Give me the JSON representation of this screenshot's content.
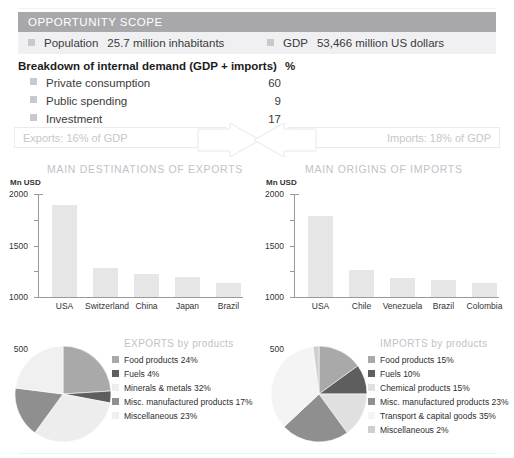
{
  "scope": {
    "header_title": "OPPORTUNITY SCOPE",
    "population_label": "Population",
    "population_value": "25.7 million inhabitants",
    "gdp_label": "GDP",
    "gdp_value": "53,466 million US dollars"
  },
  "breakdown": {
    "title": "Breakdown of internal demand (GDP + imports)",
    "unit": "%",
    "rows": [
      {
        "label": "Private consumption",
        "value": "60"
      },
      {
        "label": "Public spending",
        "value": "9"
      },
      {
        "label": "Investment",
        "value": "17"
      }
    ]
  },
  "flows": {
    "exports_label": "Exports: 16% of GDP",
    "imports_label": "Imports: 18% of GDP"
  },
  "sections": {
    "exports_title": "MAIN DESTINATIONS OF EXPORTS",
    "imports_title": "MAIN ORIGINS OF IMPORTS"
  },
  "colors": {
    "header_bar": "#a8a8ac",
    "panel_row": "#f0f0f2",
    "bullet": "#c9c9cd",
    "bar_fill": "#e6e6e6",
    "muted_title": "#c3c1c8",
    "pie_food": "#a9a9a9",
    "pie_fuels": "#5e5e5e",
    "pie_minerals": "#ededed",
    "pie_misc_manuf": "#8f8f8f",
    "pie_miscellaneous": "#f0f0f0",
    "pie_chemical": "#e0e0e0",
    "pie_transport": "#f4f4f4"
  },
  "chart_data": [
    {
      "type": "bar",
      "title": "MAIN DESTINATIONS OF EXPORTS",
      "ylabel": "Mn USD",
      "xlabel": "",
      "categories": [
        "USA",
        "Switzerland",
        "China",
        "Japan",
        "Brazil"
      ],
      "values": [
        1790,
        560,
        450,
        385,
        265
      ],
      "ylim": [
        0,
        2000
      ],
      "yticks": [
        0,
        500,
        1000,
        1500,
        2000
      ],
      "ytick_labels": [
        "0",
        "500",
        "1000",
        "1500",
        "2000"
      ],
      "grid": false,
      "legend": "none"
    },
    {
      "type": "bar",
      "title": "MAIN ORIGINS OF IMPORTS",
      "ylabel": "Mn USD",
      "xlabel": "",
      "categories": [
        "USA",
        "Chile",
        "Venezuela",
        "Brazil",
        "Colombia"
      ],
      "values": [
        1575,
        530,
        375,
        340,
        280
      ],
      "ylim": [
        0,
        2000
      ],
      "yticks": [
        0,
        500,
        1000,
        1500,
        2000
      ],
      "ytick_labels": [
        "0",
        "500",
        "1000",
        "1500",
        "2000"
      ],
      "grid": false,
      "legend": "none"
    },
    {
      "type": "pie",
      "title": "EXPORTS by products",
      "legend_position": "right",
      "labels": [
        "Food products 24%",
        "Fuels 4%",
        "Minerals & metals 32%",
        "Misc. manufactured products 17%",
        "Miscellaneous 23%"
      ],
      "categories": [
        "Food products",
        "Fuels",
        "Minerals & metals",
        "Misc. manufactured products",
        "Miscellaneous"
      ],
      "values": [
        24,
        4,
        32,
        17,
        23
      ],
      "colors": [
        "#a9a9a9",
        "#5e5e5e",
        "#ededed",
        "#8f8f8f",
        "#f0f0f0"
      ]
    },
    {
      "type": "pie",
      "title": "IMPORTS by products",
      "legend_position": "right",
      "labels": [
        "Food products 15%",
        "Fuels 10%",
        "Chemical products 15%",
        "Misc. manufactured products 23%",
        "Transport & capital goods 35%",
        "Miscellaneous 2%"
      ],
      "categories": [
        "Food products",
        "Fuels",
        "Chemical products",
        "Misc. manufactured products",
        "Transport & capital goods",
        "Miscellaneous"
      ],
      "values": [
        15,
        10,
        15,
        23,
        35,
        2
      ],
      "colors": [
        "#a9a9a9",
        "#5e5e5e",
        "#e0e0e0",
        "#8f8f8f",
        "#f4f4f4",
        "#cfcfcf"
      ]
    }
  ]
}
